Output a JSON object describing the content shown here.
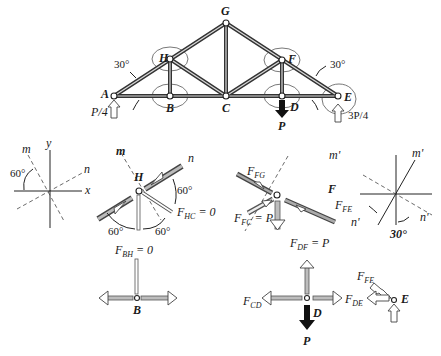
{
  "truss": {
    "joints": {
      "A": "A",
      "B": "B",
      "C": "C",
      "D": "D",
      "E": "E",
      "F": "F",
      "G": "G",
      "H": "H"
    },
    "angle_left": "30°",
    "angle_right": "30°",
    "reaction_A": "P/4",
    "reaction_E": "3P/4",
    "load": "P"
  },
  "axes_left": {
    "y": "y",
    "x": "x",
    "m": "m",
    "n": "n",
    "angle": "60°"
  },
  "joint_H": {
    "label": "H",
    "m": "m",
    "n": "n",
    "angle_1": "60°",
    "angle_2": "60°",
    "angle_3": "60°",
    "f_hc": "F",
    "f_hc_sub": "HC",
    "f_hc_val": " = 0",
    "f_bh": "F",
    "f_bh_sub": "BH",
    "f_bh_val": " = 0"
  },
  "joint_F": {
    "label": "F",
    "m": "m'",
    "n": "n'",
    "f_fg": "F",
    "f_fg_sub": "FG",
    "f_fe": "F",
    "f_fe_sub": "FE",
    "f_fc": "F",
    "f_fc_sub": "FC",
    "f_fc_val": " = P",
    "f_df": "F",
    "f_df_sub": "DF",
    "f_df_val": " = P"
  },
  "axes_right": {
    "m": "m'",
    "n": "n'",
    "angle": "30°"
  },
  "joint_B": {
    "label": "B"
  },
  "joint_D": {
    "label": "D",
    "load": "P",
    "f_cd": "F",
    "f_cd_sub": "CD",
    "f_de": "F",
    "f_de_sub": "DE"
  },
  "joint_E": {
    "label": "E",
    "f_fe": "F",
    "f_fe_sub": "FE"
  }
}
